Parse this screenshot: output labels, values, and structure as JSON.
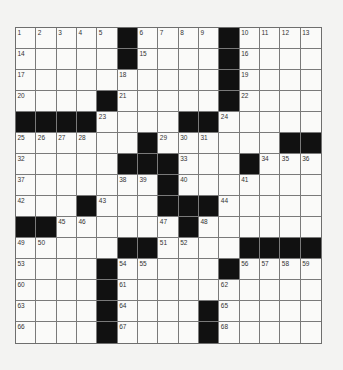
{
  "puzzle": {
    "rows": 15,
    "cols": 15,
    "colors": {
      "background": "#f3f3f2",
      "cell": "#fafaf9",
      "block": "#111111",
      "gridline": "#7a7a7a"
    },
    "layout": [
      ".....#....#....",
      ".....#....#....",
      "..........#....",
      "....#.....#....",
      "####....##.....",
      "......#......##",
      ".....###...#...",
      ".......#.......",
      "...#...###.....",
      "##......#......",
      ".....##....####",
      "....#.....#....",
      "....#..........",
      "....#....#.....",
      "....#....#....."
    ],
    "numbers": [
      {
        "r": 0,
        "c": 0,
        "n": "1"
      },
      {
        "r": 0,
        "c": 1,
        "n": "2"
      },
      {
        "r": 0,
        "c": 2,
        "n": "3"
      },
      {
        "r": 0,
        "c": 3,
        "n": "4"
      },
      {
        "r": 0,
        "c": 4,
        "n": "5"
      },
      {
        "r": 0,
        "c": 6,
        "n": "6"
      },
      {
        "r": 0,
        "c": 7,
        "n": "7"
      },
      {
        "r": 0,
        "c": 8,
        "n": "8"
      },
      {
        "r": 0,
        "c": 9,
        "n": "9"
      },
      {
        "r": 0,
        "c": 11,
        "n": "10"
      },
      {
        "r": 0,
        "c": 12,
        "n": "11"
      },
      {
        "r": 0,
        "c": 13,
        "n": "12"
      },
      {
        "r": 0,
        "c": 14,
        "n": "13"
      },
      {
        "r": 1,
        "c": 0,
        "n": "14"
      },
      {
        "r": 1,
        "c": 6,
        "n": "15"
      },
      {
        "r": 1,
        "c": 11,
        "n": "16"
      },
      {
        "r": 2,
        "c": 0,
        "n": "17"
      },
      {
        "r": 2,
        "c": 5,
        "n": "18"
      },
      {
        "r": 2,
        "c": 11,
        "n": "19"
      },
      {
        "r": 3,
        "c": 0,
        "n": "20"
      },
      {
        "r": 3,
        "c": 5,
        "n": "21"
      },
      {
        "r": 3,
        "c": 11,
        "n": "22"
      },
      {
        "r": 4,
        "c": 4,
        "n": "23"
      },
      {
        "r": 4,
        "c": 10,
        "n": "24"
      },
      {
        "r": 5,
        "c": 0,
        "n": "25"
      },
      {
        "r": 5,
        "c": 1,
        "n": "26"
      },
      {
        "r": 5,
        "c": 2,
        "n": "27"
      },
      {
        "r": 5,
        "c": 3,
        "n": "28"
      },
      {
        "r": 5,
        "c": 7,
        "n": "29"
      },
      {
        "r": 5,
        "c": 8,
        "n": "30"
      },
      {
        "r": 5,
        "c": 9,
        "n": "31"
      },
      {
        "r": 6,
        "c": 0,
        "n": "32"
      },
      {
        "r": 6,
        "c": 8,
        "n": "33"
      },
      {
        "r": 6,
        "c": 12,
        "n": "34"
      },
      {
        "r": 6,
        "c": 13,
        "n": "35"
      },
      {
        "r": 6,
        "c": 14,
        "n": "36"
      },
      {
        "r": 7,
        "c": 0,
        "n": "37"
      },
      {
        "r": 7,
        "c": 5,
        "n": "38"
      },
      {
        "r": 7,
        "c": 6,
        "n": "39"
      },
      {
        "r": 7,
        "c": 8,
        "n": "40"
      },
      {
        "r": 7,
        "c": 11,
        "n": "41"
      },
      {
        "r": 8,
        "c": 0,
        "n": "42"
      },
      {
        "r": 8,
        "c": 4,
        "n": "43"
      },
      {
        "r": 8,
        "c": 10,
        "n": "44"
      },
      {
        "r": 9,
        "c": 2,
        "n": "45"
      },
      {
        "r": 9,
        "c": 3,
        "n": "46"
      },
      {
        "r": 9,
        "c": 7,
        "n": "47"
      },
      {
        "r": 9,
        "c": 9,
        "n": "48"
      },
      {
        "r": 10,
        "c": 0,
        "n": "49"
      },
      {
        "r": 10,
        "c": 1,
        "n": "50"
      },
      {
        "r": 10,
        "c": 7,
        "n": "51"
      },
      {
        "r": 10,
        "c": 8,
        "n": "52"
      },
      {
        "r": 11,
        "c": 0,
        "n": "53"
      },
      {
        "r": 11,
        "c": 5,
        "n": "54"
      },
      {
        "r": 11,
        "c": 6,
        "n": "55"
      },
      {
        "r": 11,
        "c": 11,
        "n": "56"
      },
      {
        "r": 11,
        "c": 12,
        "n": "57"
      },
      {
        "r": 11,
        "c": 13,
        "n": "58"
      },
      {
        "r": 11,
        "c": 14,
        "n": "59"
      },
      {
        "r": 12,
        "c": 0,
        "n": "60"
      },
      {
        "r": 12,
        "c": 5,
        "n": "61"
      },
      {
        "r": 12,
        "c": 10,
        "n": "62"
      },
      {
        "r": 13,
        "c": 0,
        "n": "63"
      },
      {
        "r": 13,
        "c": 5,
        "n": "64"
      },
      {
        "r": 13,
        "c": 10,
        "n": "65"
      },
      {
        "r": 14,
        "c": 0,
        "n": "66"
      },
      {
        "r": 14,
        "c": 5,
        "n": "67"
      },
      {
        "r": 14,
        "c": 10,
        "n": "68"
      }
    ]
  }
}
